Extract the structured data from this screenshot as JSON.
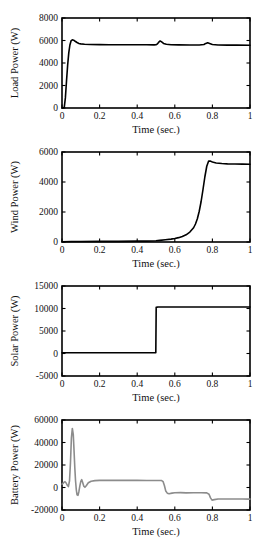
{
  "figure": {
    "background": "#ffffff",
    "axis_color": "#000000",
    "panel_count": 4
  },
  "chart_data": [
    {
      "type": "line",
      "title": "",
      "xlabel": "Time (sec.)",
      "ylabel": "Load Power (W)",
      "xlim": [
        0,
        1
      ],
      "ylim": [
        0,
        8000
      ],
      "xticks": [
        0,
        0.2,
        0.4,
        0.6,
        0.8,
        1
      ],
      "xticklabels": [
        "0",
        "0.2",
        "0.4",
        "0.6",
        "0.8",
        "1"
      ],
      "yticks": [
        0,
        2000,
        4000,
        6000,
        8000
      ],
      "yticklabels": [
        "0",
        "2000",
        "4000",
        "6000",
        "8000"
      ],
      "grid": false,
      "legend": null,
      "line_color": "#000000",
      "line_width": 1.6,
      "series": [
        {
          "name": "Load Power",
          "x": [
            0,
            0.005,
            0.012,
            0.018,
            0.024,
            0.03,
            0.036,
            0.042,
            0.048,
            0.055,
            0.062,
            0.07,
            0.08,
            0.09,
            0.1,
            0.12,
            0.15,
            0.2,
            0.25,
            0.3,
            0.35,
            0.4,
            0.45,
            0.49,
            0.5,
            0.508,
            0.515,
            0.522,
            0.53,
            0.54,
            0.555,
            0.58,
            0.62,
            0.68,
            0.73,
            0.755,
            0.765,
            0.775,
            0.785,
            0.8,
            0.83,
            0.88,
            0.93,
            1.0
          ],
          "y": [
            0,
            10,
            60,
            900,
            2400,
            3800,
            4900,
            5600,
            5960,
            6060,
            6030,
            5930,
            5820,
            5740,
            5700,
            5660,
            5640,
            5630,
            5625,
            5620,
            5620,
            5620,
            5618,
            5615,
            5620,
            5700,
            5860,
            5960,
            5880,
            5740,
            5660,
            5620,
            5610,
            5600,
            5600,
            5640,
            5740,
            5800,
            5740,
            5650,
            5600,
            5590,
            5585,
            5580
          ]
        }
      ]
    },
    {
      "type": "line",
      "title": "",
      "xlabel": "Time (sec.)",
      "ylabel": "Wind Power (W)",
      "xlim": [
        0,
        1
      ],
      "ylim": [
        0,
        6000
      ],
      "xticks": [
        0,
        0.2,
        0.4,
        0.6,
        0.8,
        1
      ],
      "xticklabels": [
        "0",
        "0.2",
        "0.4",
        "0.6",
        "0.8",
        "1"
      ],
      "yticks": [
        0,
        2000,
        4000,
        6000
      ],
      "yticklabels": [
        "0",
        "2000",
        "4000",
        "6000"
      ],
      "grid": false,
      "legend": null,
      "line_color": "#000000",
      "line_width": 1.6,
      "series": [
        {
          "name": "Wind Power",
          "x": [
            0,
            0.05,
            0.1,
            0.2,
            0.3,
            0.4,
            0.45,
            0.5,
            0.52,
            0.55,
            0.58,
            0.6,
            0.62,
            0.64,
            0.66,
            0.68,
            0.7,
            0.71,
            0.72,
            0.73,
            0.74,
            0.75,
            0.76,
            0.77,
            0.78,
            0.79,
            0.8,
            0.82,
            0.85,
            0.88,
            0.92,
            0.96,
            1.0
          ],
          "y": [
            20,
            30,
            35,
            40,
            45,
            55,
            60,
            80,
            110,
            150,
            190,
            230,
            290,
            370,
            480,
            660,
            950,
            1200,
            1550,
            2050,
            2700,
            3500,
            4350,
            5050,
            5400,
            5390,
            5330,
            5270,
            5230,
            5210,
            5200,
            5190,
            5180
          ]
        }
      ]
    },
    {
      "type": "line",
      "title": "",
      "xlabel": "Time (sec.)",
      "ylabel": "Solar Power (W)",
      "xlim": [
        0,
        1
      ],
      "ylim": [
        -5000,
        15000
      ],
      "xticks": [
        0,
        0.2,
        0.4,
        0.6,
        0.8,
        1
      ],
      "xticklabels": [
        "0",
        "0.2",
        "0.4",
        "0.6",
        "0.8",
        "1"
      ],
      "yticks": [
        -5000,
        0,
        5000,
        10000,
        15000
      ],
      "yticklabels": [
        "-5000",
        "0",
        "5000",
        "10000",
        "15000"
      ],
      "grid": false,
      "legend": null,
      "line_color": "#000000",
      "line_width": 1.6,
      "series": [
        {
          "name": "Solar Power",
          "x": [
            0,
            0.1,
            0.2,
            0.3,
            0.4,
            0.48,
            0.499,
            0.501,
            0.51,
            0.55,
            0.6,
            0.7,
            0.8,
            0.9,
            1.0
          ],
          "y": [
            180,
            180,
            180,
            175,
            175,
            175,
            175,
            10250,
            10330,
            10340,
            10340,
            10330,
            10330,
            10330,
            10330
          ]
        }
      ]
    },
    {
      "type": "line",
      "title": "",
      "xlabel": "Time (sec.)",
      "ylabel": "Battery Power (W)",
      "xlim": [
        0,
        1
      ],
      "ylim": [
        -20000,
        60000
      ],
      "xticks": [
        0,
        0.2,
        0.4,
        0.6,
        0.8,
        1
      ],
      "xticklabels": [
        "0",
        "0.2",
        "0.4",
        "0.6",
        "0.8",
        "1"
      ],
      "yticks": [
        -20000,
        0,
        20000,
        40000,
        60000
      ],
      "yticklabels": [
        "-20000",
        "0",
        "20000",
        "40000",
        "60000"
      ],
      "grid": false,
      "legend": null,
      "line_color": "#8c8c8c",
      "line_width": 1.6,
      "series": [
        {
          "name": "Battery Power",
          "x": [
            0,
            0.004,
            0.01,
            0.016,
            0.022,
            0.028,
            0.034,
            0.04,
            0.045,
            0.05,
            0.055,
            0.06,
            0.064,
            0.068,
            0.072,
            0.076,
            0.08,
            0.085,
            0.09,
            0.095,
            0.1,
            0.105,
            0.11,
            0.116,
            0.122,
            0.13,
            0.14,
            0.155,
            0.175,
            0.2,
            0.25,
            0.3,
            0.35,
            0.4,
            0.45,
            0.5,
            0.52,
            0.53,
            0.538,
            0.545,
            0.552,
            0.56,
            0.57,
            0.585,
            0.6,
            0.63,
            0.66,
            0.7,
            0.74,
            0.77,
            0.782,
            0.79,
            0.798,
            0.81,
            0.83,
            0.87,
            0.92,
            0.96,
            1.0
          ],
          "y": [
            3000,
            3500,
            4500,
            5200,
            4000,
            2000,
            800,
            6000,
            22000,
            44000,
            52500,
            47000,
            33000,
            18000,
            6000,
            -2000,
            -6500,
            -7000,
            -3500,
            1500,
            5500,
            7000,
            4500,
            1200,
            200,
            1800,
            4200,
            5600,
            6100,
            6300,
            6300,
            6300,
            6300,
            6300,
            6250,
            6250,
            6250,
            6200,
            5200,
            1500,
            -3200,
            -5000,
            -5600,
            -5000,
            -4700,
            -4600,
            -4800,
            -4700,
            -4700,
            -4800,
            -6000,
            -9200,
            -11200,
            -10800,
            -10200,
            -10200,
            -10200,
            -10200,
            -10300
          ]
        }
      ]
    }
  ]
}
